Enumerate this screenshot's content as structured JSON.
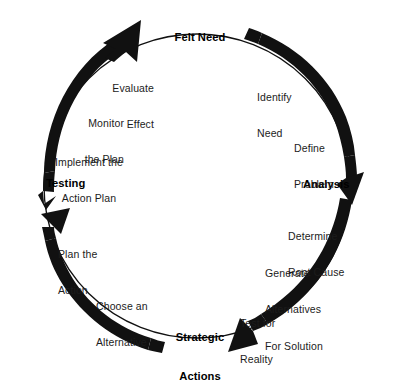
{
  "diagram": {
    "type": "cycle",
    "direction": "clockwise",
    "colors": {
      "stroke": "#111111",
      "arrow_fill": "#111111",
      "text": "#1c1c1c",
      "background": "#ffffff"
    },
    "phases": [
      {
        "id": "felt-need",
        "heading": "Felt Need",
        "position": "top",
        "steps": [
          {
            "id": "identify-need",
            "text": "Identify\nNeed"
          },
          {
            "id": "define-problem",
            "text": "Define\nProblem"
          }
        ]
      },
      {
        "id": "analysis",
        "heading": "Analysis",
        "position": "right",
        "steps": [
          {
            "id": "determine-root-cause",
            "text": "Determine\nRoot Cause"
          },
          {
            "id": "generate-alternatives",
            "text": "Generate\nAlternatives\nFor Solution"
          },
          {
            "id": "test-for-reality",
            "text": "Test for\nReality"
          }
        ]
      },
      {
        "id": "strategic-actions",
        "heading": "Strategic\nActions",
        "position": "bottom",
        "steps": [
          {
            "id": "choose-an-alternative",
            "text": "Choose an\nAlternative"
          },
          {
            "id": "plan-the-action",
            "text": "Plan the\nAction"
          }
        ]
      },
      {
        "id": "testing",
        "heading": "Testing",
        "position": "left",
        "steps": [
          {
            "id": "implement-action-plan",
            "text": "Implement the\nAction Plan"
          },
          {
            "id": "monitor-the-plan",
            "text": "Monitor\nthe Plan"
          },
          {
            "id": "evaluate-effect",
            "text": "Evaluate\nEffect"
          }
        ]
      }
    ],
    "headings": {
      "felt_need": "Felt Need",
      "analysis": "Analysis",
      "strategic_actions_line1": "Strategic",
      "strategic_actions_line2": "Actions",
      "testing": "Testing"
    },
    "labels": {
      "evaluate_effect_line1": "Evaluate",
      "evaluate_effect_line2": "Effect",
      "monitor_plan_line1": "Monitor",
      "monitor_plan_line2": "the Plan",
      "implement_plan_line1": "Implement the",
      "implement_plan_line2": "Action Plan",
      "identify_need_line1": "Identify",
      "identify_need_line2": "Need",
      "define_problem_line1": "Define",
      "define_problem_line2": "Problem",
      "determine_root_cause_line1": "Determine",
      "determine_root_cause_line2": "Root Cause",
      "generate_alternatives_line1": "Generate",
      "generate_alternatives_line2": "Alternatives",
      "generate_alternatives_line3": "For Solution",
      "test_reality_line1": "Test for",
      "test_reality_line2": "Reality",
      "choose_alternative_line1": "Choose an",
      "choose_alternative_line2": "Alternative",
      "plan_action_line1": "Plan the",
      "plan_action_line2": "Action"
    },
    "arrows": [
      {
        "id": "arrow-nw",
        "quadrant": "north-west",
        "points_to": "felt-need"
      },
      {
        "id": "arrow-ne",
        "quadrant": "north-east",
        "points_to": "analysis"
      },
      {
        "id": "arrow-se",
        "quadrant": "south-east",
        "points_to": "strategic-actions"
      },
      {
        "id": "arrow-sw",
        "quadrant": "south-west",
        "points_to": "testing"
      }
    ]
  }
}
